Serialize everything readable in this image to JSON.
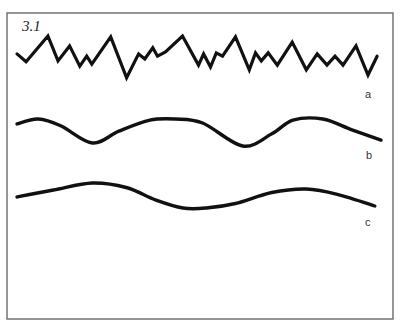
{
  "figure": {
    "label": "3.1",
    "frame_color": "#6a6a6a",
    "line_color": "#111111"
  },
  "traces": [
    {
      "id": "a",
      "label": "a",
      "style": "jagged",
      "description": "irregular high-frequency waveform",
      "points": [
        [
          0,
          0.62
        ],
        [
          2.5,
          0.45
        ],
        [
          8.5,
          1.0
        ],
        [
          11.3,
          0.47
        ],
        [
          14.5,
          0.79
        ],
        [
          17.3,
          0.36
        ],
        [
          19.2,
          0.57
        ],
        [
          20.6,
          0.4
        ],
        [
          25.8,
          0.98
        ],
        [
          30.2,
          0.11
        ],
        [
          33.5,
          0.62
        ],
        [
          35.2,
          0.51
        ],
        [
          37.4,
          0.75
        ],
        [
          38.7,
          0.57
        ],
        [
          40.9,
          0.66
        ],
        [
          45.6,
          1.0
        ],
        [
          50.0,
          0.38
        ],
        [
          51.4,
          0.62
        ],
        [
          53.3,
          0.34
        ],
        [
          54.9,
          0.64
        ],
        [
          56.6,
          0.57
        ],
        [
          60.2,
          0.98
        ],
        [
          64.0,
          0.28
        ],
        [
          65.7,
          0.64
        ],
        [
          67.3,
          0.47
        ],
        [
          69.2,
          0.64
        ],
        [
          71.7,
          0.38
        ],
        [
          75.8,
          0.87
        ],
        [
          79.7,
          0.28
        ],
        [
          82.7,
          0.62
        ],
        [
          85.4,
          0.38
        ],
        [
          87.6,
          0.57
        ],
        [
          89.8,
          0.38
        ],
        [
          93.4,
          0.79
        ],
        [
          96.7,
          0.17
        ],
        [
          99.2,
          0.57
        ]
      ]
    },
    {
      "id": "b",
      "label": "b",
      "style": "smooth",
      "description": "slow smooth undulation, two troughs",
      "points": [
        [
          0,
          0.82
        ],
        [
          5.8,
          1.0
        ],
        [
          12.0,
          0.75
        ],
        [
          20.7,
          0.11
        ],
        [
          28.0,
          0.55
        ],
        [
          36.5,
          0.96
        ],
        [
          43.5,
          1.0
        ],
        [
          51.0,
          0.85
        ],
        [
          62.0,
          0.0
        ],
        [
          70.0,
          0.45
        ],
        [
          75.8,
          0.96
        ],
        [
          84.0,
          1.0
        ],
        [
          92.0,
          0.6
        ],
        [
          100,
          0.22
        ]
      ]
    },
    {
      "id": "c",
      "label": "c",
      "style": "smooth",
      "description": "very slow smooth undulation, low amplitude",
      "points": [
        [
          0,
          0.44
        ],
        [
          10.0,
          0.72
        ],
        [
          20.7,
          1.0
        ],
        [
          30.0,
          0.82
        ],
        [
          38.0,
          0.33
        ],
        [
          45.6,
          0.0
        ],
        [
          52.0,
          0.0
        ],
        [
          60.0,
          0.18
        ],
        [
          70.0,
          0.62
        ],
        [
          79.4,
          0.76
        ],
        [
          88.0,
          0.55
        ],
        [
          98.3,
          0.08
        ]
      ]
    }
  ]
}
